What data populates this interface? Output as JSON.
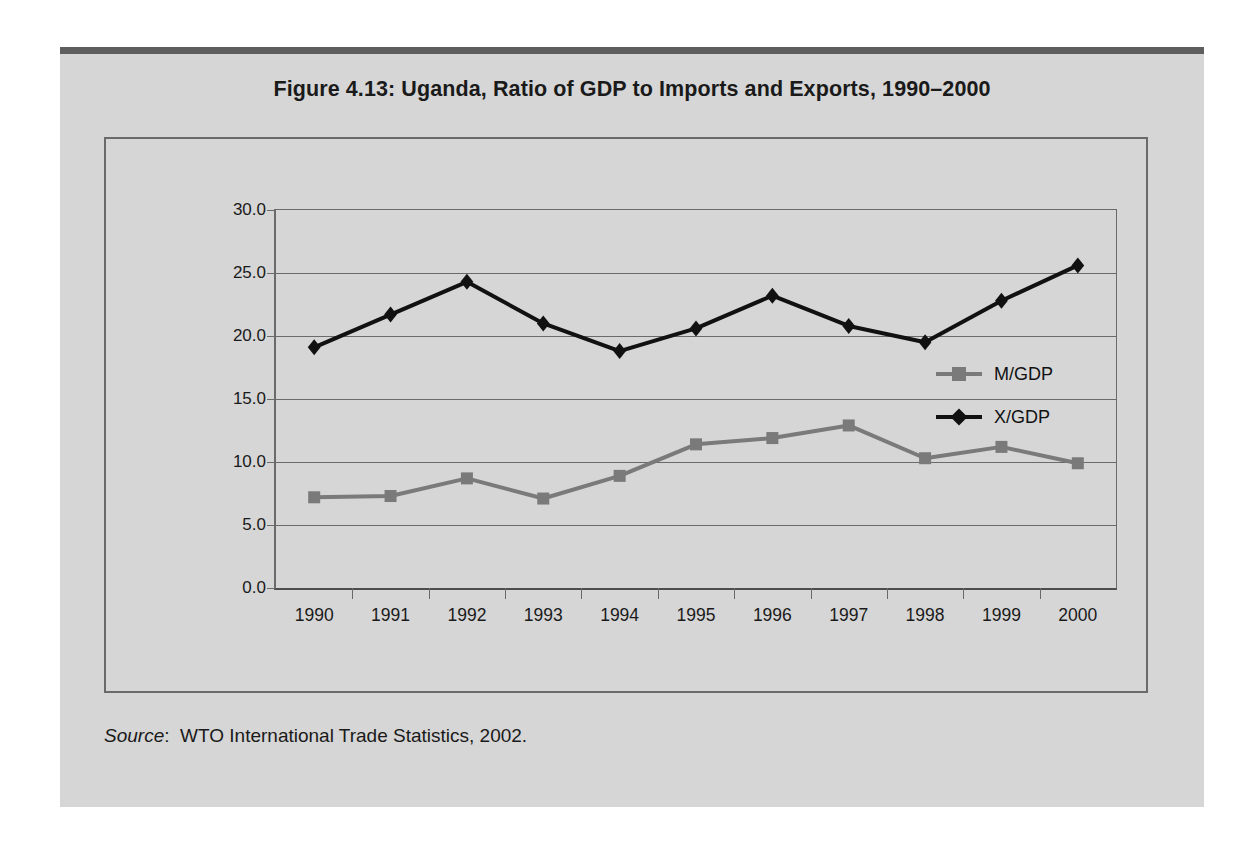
{
  "figure": {
    "title": "Figure 4.13:  Uganda, Ratio of GDP to Imports and Exports, 1990–2000",
    "source_word": "Source",
    "source_sep": ":",
    "source_text": "WTO International Trade Statistics, 2002."
  },
  "colors": {
    "page_background": "#ffffff",
    "panel_background": "#d6d6d6",
    "panel_topbar": "#5e5e5e",
    "frame_border": "#6a6a6a",
    "gridline": "#6a6a6a",
    "axis": "#4d4d4d",
    "series_m_gdp": "#7a7a7a",
    "series_x_gdp": "#111111",
    "text": "#1a1a1a"
  },
  "chart_data": {
    "type": "line",
    "title": "Figure 4.13:  Uganda, Ratio of GDP to Imports and Exports, 1990–2000",
    "xlabel": "",
    "ylabel": "",
    "categories": [
      "1990",
      "1991",
      "1992",
      "1993",
      "1994",
      "1995",
      "1996",
      "1997",
      "1998",
      "1999",
      "2000"
    ],
    "ylim": [
      0.0,
      30.0
    ],
    "ytick_labels": [
      "0.0",
      "5.0",
      "10.0",
      "15.0",
      "20.0",
      "25.0",
      "30.0"
    ],
    "ytick_values": [
      0.0,
      5.0,
      10.0,
      15.0,
      20.0,
      25.0,
      30.0
    ],
    "grid": true,
    "legend_position": "inside-right",
    "series": [
      {
        "name": "M/GDP",
        "color": "#7a7a7a",
        "marker": "square",
        "values": [
          7.2,
          7.3,
          8.7,
          7.1,
          8.9,
          11.4,
          11.9,
          12.9,
          10.3,
          11.2,
          9.9
        ]
      },
      {
        "name": "X/GDP",
        "color": "#111111",
        "marker": "diamond",
        "values": [
          19.1,
          21.7,
          24.3,
          21.0,
          18.8,
          20.6,
          23.2,
          20.8,
          19.5,
          22.8,
          25.6
        ]
      }
    ]
  }
}
